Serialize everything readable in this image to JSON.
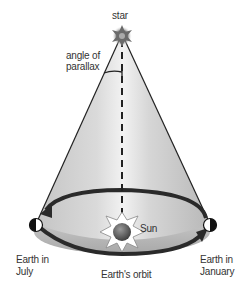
{
  "diagram": {
    "labels": {
      "star": "star",
      "angle_line1": "angle of",
      "angle_line2": "parallax",
      "sun": "Sun",
      "earth_july_line1": "Earth in",
      "earth_july_line2": "July",
      "earth_january_line1": "Earth in",
      "earth_january_line2": "January",
      "orbit": "Earth's orbit"
    },
    "colors": {
      "cone_light": "#e6e6e6",
      "cone_mid": "#cfcfcf",
      "cone_dark": "#b5b5b5",
      "orbit_arrow": "#2a2a2a",
      "line": "#222222",
      "text": "#333333"
    }
  }
}
